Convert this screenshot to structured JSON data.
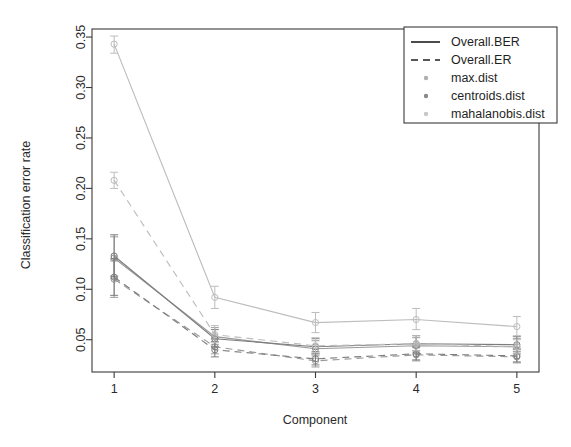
{
  "chart_data": {
    "type": "line",
    "title": "",
    "xlabel": "Component",
    "ylabel": "Classification error rate",
    "x": [
      1,
      2,
      3,
      4,
      5
    ],
    "xticklabels": [
      "1",
      "2",
      "3",
      "4",
      "5"
    ],
    "yticks": [
      0.05,
      0.1,
      0.15,
      0.2,
      0.25,
      0.3,
      0.35
    ],
    "yticklabels": [
      "0.05",
      "0.10",
      "0.15",
      "0.20",
      "0.25",
      "0.30",
      "0.35"
    ],
    "xlim": [
      0.78,
      5.22
    ],
    "ylim": [
      0.018,
      0.358
    ],
    "grid": false,
    "legend_position": "top-right",
    "error_bars": true,
    "series": [
      {
        "name": "Overall.BER / max.dist",
        "linetype": "solid",
        "dist": "max.dist",
        "measure": "Overall.BER",
        "color": "#9a9a9a",
        "values": [
          0.131,
          0.053,
          0.041,
          0.044,
          0.043
        ],
        "err_low": [
          0.111,
          0.045,
          0.034,
          0.037,
          0.036
        ],
        "err_high": [
          0.152,
          0.062,
          0.049,
          0.052,
          0.051
        ]
      },
      {
        "name": "Overall.ER / max.dist",
        "linetype": "dashed",
        "dist": "max.dist",
        "measure": "Overall.ER",
        "color": "#9a9a9a",
        "values": [
          0.11,
          0.043,
          0.029,
          0.035,
          0.033
        ],
        "err_low": [
          0.092,
          0.036,
          0.023,
          0.029,
          0.027
        ],
        "err_high": [
          0.128,
          0.051,
          0.036,
          0.042,
          0.04
        ]
      },
      {
        "name": "Overall.BER / centroids.dist",
        "linetype": "solid",
        "dist": "centroids.dist",
        "measure": "Overall.BER",
        "color": "#7d7d7d",
        "values": [
          0.133,
          0.051,
          0.043,
          0.046,
          0.045
        ],
        "err_low": [
          0.113,
          0.043,
          0.036,
          0.039,
          0.038
        ],
        "err_high": [
          0.154,
          0.06,
          0.051,
          0.054,
          0.053
        ]
      },
      {
        "name": "Overall.ER / centroids.dist",
        "linetype": "dashed",
        "dist": "centroids.dist",
        "measure": "Overall.ER",
        "color": "#7d7d7d",
        "values": [
          0.112,
          0.04,
          0.031,
          0.036,
          0.034
        ],
        "err_low": [
          0.094,
          0.033,
          0.025,
          0.03,
          0.028
        ],
        "err_high": [
          0.13,
          0.048,
          0.038,
          0.043,
          0.041
        ]
      },
      {
        "name": "Overall.BER / mahalanobis.dist",
        "linetype": "solid",
        "dist": "mahalanobis.dist",
        "measure": "Overall.BER",
        "color": "#bdbdbd",
        "values": [
          0.343,
          0.092,
          0.067,
          0.07,
          0.063
        ],
        "err_low": [
          0.334,
          0.081,
          0.057,
          0.06,
          0.054
        ],
        "err_high": [
          0.351,
          0.103,
          0.077,
          0.081,
          0.073
        ]
      },
      {
        "name": "Overall.ER / mahalanobis.dist",
        "linetype": "dashed",
        "dist": "mahalanobis.dist",
        "measure": "Overall.ER",
        "color": "#bdbdbd",
        "values": [
          0.208,
          0.055,
          0.044,
          0.046,
          0.043
        ],
        "err_low": [
          0.2,
          0.047,
          0.037,
          0.039,
          0.036
        ],
        "err_high": [
          0.216,
          0.064,
          0.052,
          0.054,
          0.05
        ]
      }
    ]
  },
  "legend": {
    "items": [
      {
        "label": "Overall.BER",
        "marker": "solid-line",
        "color": "#1f1f1f"
      },
      {
        "label": "Overall.ER",
        "marker": "dashed-line",
        "color": "#1f1f1f"
      },
      {
        "label": "max.dist",
        "marker": "dot",
        "color": "#b0b0b0"
      },
      {
        "label": "centroids.dist",
        "marker": "dot",
        "color": "#8a8a8a"
      },
      {
        "label": "mahalanobis.dist",
        "marker": "dot",
        "color": "#c8c8c8"
      }
    ]
  }
}
